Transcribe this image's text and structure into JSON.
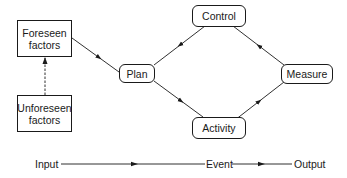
{
  "diagram": {
    "nodes": {
      "foreseen": {
        "line1": "Foreseen",
        "line2": "factors"
      },
      "unforeseen": {
        "line1": "Unforeseen",
        "line2": "factors"
      },
      "plan": "Plan",
      "control": "Control",
      "activity": "Activity",
      "measure": "Measure"
    },
    "edges": [
      {
        "from": "Foreseen factors",
        "to": "Plan",
        "style": "solid"
      },
      {
        "from": "Unforeseen factors",
        "to": "Foreseen factors",
        "style": "dashed"
      },
      {
        "from": "Plan",
        "to": "Activity",
        "style": "solid"
      },
      {
        "from": "Activity",
        "to": "Measure",
        "style": "solid"
      },
      {
        "from": "Measure",
        "to": "Control",
        "style": "solid"
      },
      {
        "from": "Control",
        "to": "Plan",
        "style": "solid"
      }
    ],
    "timeline": {
      "input": "Input",
      "event": "Event",
      "output": "Output"
    },
    "colors": {
      "ink": "#1a1a1a",
      "background": "#ffffff"
    }
  }
}
